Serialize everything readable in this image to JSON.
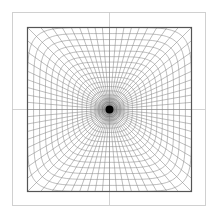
{
  "figure": {
    "canvas": {
      "width": 218,
      "height": 218,
      "background": "#ffffff"
    },
    "outer_frame": {
      "x": 12,
      "y": 12,
      "size": 193,
      "color": "#d0d0d0",
      "stroke_width": 1
    },
    "inner_frame": {
      "x": 27,
      "y": 27,
      "size": 164,
      "color": "#555555",
      "stroke_width": 1.2
    },
    "crosshair": {
      "cx": 109,
      "cy": 109,
      "extent_from": 0,
      "extent_to": 218,
      "color": "#c8c8c8",
      "stroke_width": 0.8
    },
    "center": {
      "x": 109,
      "y": 109,
      "dot_radius": 4,
      "color": "#000000"
    },
    "grid": {
      "spoke_count": 72,
      "contour_count": 18,
      "max_half_extent": 82,
      "superellipse_exponent_outer": 6,
      "color": "#888888",
      "stroke_width": 0.55
    }
  }
}
